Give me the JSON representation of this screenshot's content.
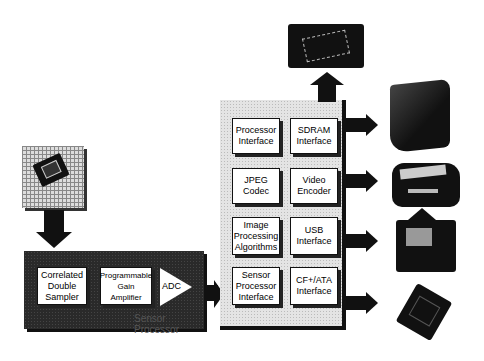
{
  "diagram": {
    "sensor_processor": {
      "label": "Sensor Processor",
      "blocks": [
        {
          "id": "cds",
          "label": "Correlated\nDouble\nSampler"
        },
        {
          "id": "pga",
          "label": "Programmable\nGain\nAmplifier"
        },
        {
          "id": "adc",
          "label": "ADC"
        }
      ]
    },
    "image_processor": {
      "blocks": [
        {
          "id": "proc-if",
          "label": "Processor\nInterface"
        },
        {
          "id": "sdram-if",
          "label": "SDRAM\nInterface"
        },
        {
          "id": "jpeg",
          "label": "JPEG\nCodec"
        },
        {
          "id": "video-enc",
          "label": "Video\nEncoder"
        },
        {
          "id": "img-proc",
          "label": "Image\nProcessing\nAlgorithms"
        },
        {
          "id": "usb-if",
          "label": "USB\nInterface"
        },
        {
          "id": "sensor-if",
          "label": "Sensor\nProcessor\nInterface"
        },
        {
          "id": "cf-ata",
          "label": "CF+/ATA\nInterface"
        }
      ]
    },
    "peripherals": {
      "image_sensor": "ccd-sensor-chip-image",
      "memory_chip": "sdram-chip-image",
      "tv": "television-image",
      "printer": "printer-image",
      "computer": "computer-image",
      "memory_card": "compact-flash-card-image"
    }
  }
}
